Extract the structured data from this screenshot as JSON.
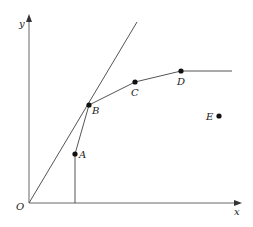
{
  "diagram": {
    "axes": {
      "origin_label": "O",
      "x_label": "x",
      "y_label": "y"
    },
    "points": [
      {
        "id": "A",
        "label": "A"
      },
      {
        "id": "B",
        "label": "B"
      },
      {
        "id": "C",
        "label": "C"
      },
      {
        "id": "D",
        "label": "D"
      },
      {
        "id": "E",
        "label": "E"
      }
    ]
  }
}
